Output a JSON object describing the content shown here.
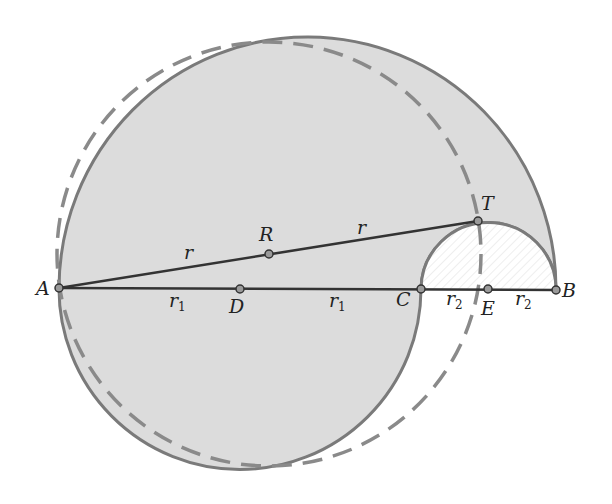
{
  "figure": {
    "colors": {
      "fill": "#dcdcdc",
      "outline": "#7a7a7a",
      "segment": "#333333",
      "dashed": "#8a8a8a",
      "point_fill": "#9a9a9a",
      "hatch": "#eeeeee"
    },
    "points": [
      {
        "id": "A",
        "label": "A",
        "x": 59,
        "y": 288
      },
      {
        "id": "R",
        "label": "R",
        "x": 269,
        "y": 254
      },
      {
        "id": "T",
        "label": "T",
        "x": 478,
        "y": 221
      },
      {
        "id": "D",
        "label": "D",
        "x": 240,
        "y": 289
      },
      {
        "id": "C",
        "label": "C",
        "x": 421,
        "y": 289
      },
      {
        "id": "E",
        "label": "E",
        "x": 488,
        "y": 289
      },
      {
        "id": "B",
        "label": "B",
        "x": 556,
        "y": 290
      }
    ],
    "segment_labels": {
      "AR": "r",
      "RT": "r",
      "AD": "r",
      "AD_sub": "1",
      "DC": "r",
      "DC_sub": "1",
      "CE": "r",
      "CE_sub": "2",
      "EB": "r",
      "EB_sub": "2"
    }
  }
}
